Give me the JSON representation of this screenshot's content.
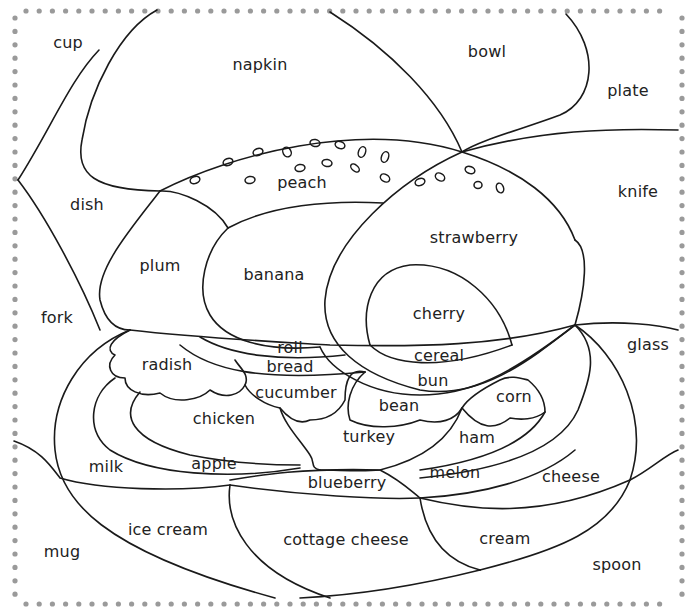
{
  "diagram": {
    "type": "coloring-worksheet",
    "border": {
      "style": "dotted",
      "color": "#9a9a9a"
    },
    "line_color": "#1a1a1a",
    "labels": {
      "cup": "cup",
      "napkin": "napkin",
      "bowl": "bowl",
      "plate": "plate",
      "dish": "dish",
      "peach": "peach",
      "knife": "knife",
      "strawberry": "strawberry",
      "plum": "plum",
      "banana": "banana",
      "cherry": "cherry",
      "fork": "fork",
      "roll": "roll",
      "cereal": "cereal",
      "glass": "glass",
      "radish": "radish",
      "bread": "bread",
      "bun": "bun",
      "cucumber": "cucumber",
      "bean": "bean",
      "corn": "corn",
      "chicken": "chicken",
      "turkey": "turkey",
      "ham": "ham",
      "milk": "milk",
      "apple": "apple",
      "melon": "melon",
      "cheese": "cheese",
      "blueberry": "blueberry",
      "ice_cream": "ice cream",
      "cottage_cheese": "cottage cheese",
      "cream": "cream",
      "mug": "mug",
      "spoon": "spoon"
    }
  }
}
